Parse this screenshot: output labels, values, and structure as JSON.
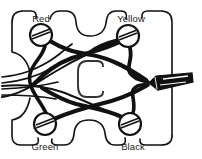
{
  "figure": {
    "kind": "wiring-harness-diagram",
    "background_color": "#ffffff",
    "line_color": "#111111",
    "label_color": "#1a1a1a"
  },
  "terminals": [
    {
      "id": "red",
      "label": "Red",
      "cx": 41,
      "cy": 35,
      "r": 11,
      "label_x": 41,
      "label_y": 19,
      "slot_angle": -20
    },
    {
      "id": "yellow",
      "label": "Yellow",
      "cx": 128,
      "cy": 36,
      "r": 11,
      "label_x": 130,
      "label_y": 20,
      "slot_angle": -20
    },
    {
      "id": "green",
      "label": "Green",
      "cx": 45,
      "cy": 124,
      "r": 11,
      "label_x": 45,
      "label_y": 147,
      "slot_angle": -20
    },
    {
      "id": "black",
      "label": "Black",
      "cx": 130,
      "cy": 124,
      "r": 11,
      "label_x": 133,
      "label_y": 147,
      "slot_angle": -20
    }
  ],
  "center_mark": {
    "id": "c-shape",
    "glyph": "C",
    "x": 78,
    "y": 62,
    "width": 30,
    "height": 36
  },
  "connector": {
    "id": "right-edge-connector",
    "x": 148,
    "y": 76,
    "width": 44,
    "height": 13,
    "fill": "#111111"
  },
  "left_exit_wires": {
    "count": 4,
    "edge_x": 0,
    "y_values": [
      77,
      83,
      89,
      95
    ]
  },
  "panel_outline": {
    "description": "rounded panel with scalloped cutouts on top and bottom edges",
    "left": 12,
    "top": 11,
    "right": 172,
    "bottom": 145,
    "corner_radius": 9
  }
}
